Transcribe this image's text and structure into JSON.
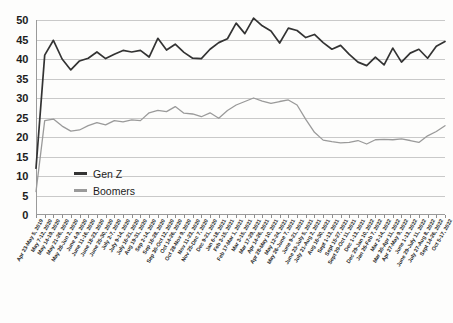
{
  "chart_data": {
    "type": "line",
    "title": "",
    "xlabel": "",
    "ylabel": "",
    "ylim": [
      0,
      50
    ],
    "yticks": [
      0,
      5,
      10,
      15,
      20,
      25,
      30,
      35,
      40,
      45,
      50
    ],
    "grid": "horizontal",
    "legend_position": "inside-lower-left",
    "colors": {
      "genz": "#333333",
      "boomers": "#9a9a9a",
      "gridline": "#c9c9c9",
      "axis": "#9a9a9a"
    },
    "categories": [
      "Apr 23-May 5, 2019",
      "May 7-12, 2020",
      "May 14-19, 2020",
      "May 21-26, 2020",
      "May 28-Jun 2, 2020",
      "June 4-9, 2020",
      "June 11-16, 2020",
      "June 18-23, 2020",
      "June 25-30, 2020",
      "July 2-7, 2020",
      "July 9-14, 2020",
      "July 16-21, 2020",
      "Aug 19-31, 2020",
      "Sep 2-14, 2020",
      "Sep 16-28, 2020",
      "Sep 30-Oct 12, 2020",
      "Oct 14-26, 2020",
      "Oct 28-Nov 9, 2020",
      "Nov 11-23, 2020",
      "Nov 25-Dec 7, 2020",
      "Dec 9-21, 2020",
      "Jan 6-18, 2021",
      "Feb 3-15, 2021",
      "Feb 17-Mar 1, 2021",
      "Mar 3-15, 2021",
      "Mar 17-29, 2021",
      "Apr 14-26, 2021",
      "Apr 28-May 10, 2021",
      "May 12-24, 2021",
      "May 26-June 7, 2021",
      "June 9-21, 2021",
      "June 23-July 5, 2021",
      "July 21-Aug 2, 2021",
      "Aug 16-30, 2021",
      "Sept 1-13, 2021",
      "Sept 15-27, 2021",
      "Sept 29-Oct 11, 2021",
      "Dec 1-13, 2021",
      "Dec 29-Jan 10, 2022",
      "Jan 26-Feb 7, 2022",
      "Mar 2-14, 2022",
      "Mar 30-Apr 11, 2022",
      "Apr 27-May 9, 2022",
      "June 1-13, 2022",
      "June 29-July 11, 2022",
      "July 27-Aug 8, 2022",
      "Sept 14-26, 2022",
      "Oct 5-17, 2022"
    ],
    "series": [
      {
        "name": "Gen Z",
        "color": "#333333",
        "values": [
          12,
          41,
          44.8,
          40,
          37.2,
          39.5,
          40.2,
          41.8,
          40.1,
          41.2,
          42.2,
          41.8,
          42.2,
          40.5,
          45.3,
          42.3,
          43.8,
          41.7,
          40.2,
          40.1,
          42.5,
          44.2,
          45.2,
          49.2,
          46.5,
          50.5,
          48.5,
          47.2,
          44.1,
          47.9,
          47.3,
          45.5,
          46.3,
          44.2,
          42.5,
          43.5,
          41.2,
          39.2,
          38.3,
          40.5,
          38.5,
          42.8,
          39.2,
          41.5,
          42.5,
          40.2,
          43.3,
          44.5
        ]
      },
      {
        "name": "Boomers",
        "color": "#9a9a9a",
        "values": [
          6,
          24.2,
          24.6,
          22.8,
          21.5,
          21.8,
          22.9,
          23.7,
          23.1,
          24.2,
          23.9,
          24.4,
          24.2,
          26.2,
          26.8,
          26.5,
          27.8,
          26.1,
          25.9,
          25.2,
          26.2,
          24.8,
          26.8,
          28.2,
          29.1,
          30.0,
          29.2,
          28.6,
          29.1,
          29.5,
          28.2,
          24.5,
          21.2,
          19.2,
          18.8,
          18.5,
          18.6,
          19.1,
          18.2,
          19.3,
          19.4,
          19.3,
          19.5,
          19.1,
          18.6,
          20.3,
          21.4,
          22.9
        ]
      }
    ]
  },
  "legend": {
    "items": [
      {
        "label": "Gen Z"
      },
      {
        "label": "Boomers"
      }
    ]
  }
}
